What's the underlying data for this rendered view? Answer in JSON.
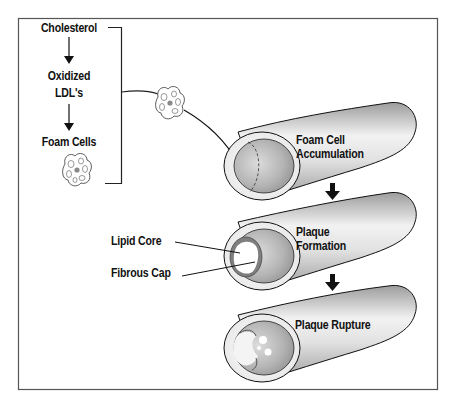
{
  "diagram": {
    "flow": {
      "steps": [
        {
          "label": "Cholesterol"
        },
        {
          "label_line1": "Oxidized",
          "label_line2": "LDL's"
        },
        {
          "label": "Foam Cells"
        }
      ]
    },
    "stages": [
      {
        "line1": "Foam Cell",
        "line2": "Accumulation"
      },
      {
        "line1": "Plaque",
        "line2": "Formation"
      },
      {
        "line1": "Plaque Rupture"
      }
    ],
    "callouts": {
      "lipid_core": "Lipid Core",
      "fibrous_cap": "Fibrous Cap"
    },
    "colors": {
      "frame": "#555555",
      "stroke": "#111111",
      "vessel_light": "#f4f4f4",
      "vessel_dark": "#9a9a9a",
      "lumen": "#a8a8a8",
      "foam_cell_nucleus": "#8a8a8a"
    }
  }
}
